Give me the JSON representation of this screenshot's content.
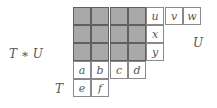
{
  "labels": {
    "product": "T ∗ U",
    "t": "T",
    "u": "U"
  },
  "colors": {
    "shaded": "#a9a9a9",
    "border": "#8a8a8a"
  },
  "shaded_block": {
    "rows": 3,
    "cols": 4
  },
  "tableau_U": {
    "rows": [
      [
        "u",
        "v",
        "w"
      ],
      [
        "x"
      ],
      [
        "y"
      ]
    ]
  },
  "tableau_T": {
    "rows": [
      [
        "a",
        "b",
        "c",
        "d"
      ],
      [
        "e",
        "f"
      ]
    ]
  }
}
